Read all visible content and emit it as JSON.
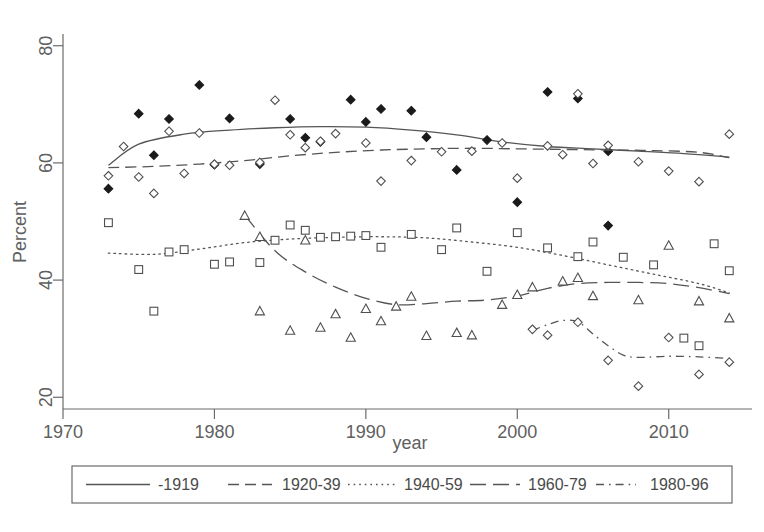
{
  "chart_data": {
    "type": "scatter",
    "title": "",
    "xlabel": "year",
    "ylabel": "Percent",
    "xlim": [
      1970,
      2015.5
    ],
    "ylim": [
      18,
      82
    ],
    "xticks": [
      1970,
      1980,
      1990,
      2000,
      2010
    ],
    "yticks": [
      20,
      40,
      60,
      80
    ],
    "grid": false,
    "legend_position": "below-axes",
    "series": [
      {
        "name": "-1919",
        "marker": "filled-diamond",
        "linestyle": "solid",
        "points": [
          {
            "x": 1973,
            "y": 55.6
          },
          {
            "x": 1975,
            "y": 68.4
          },
          {
            "x": 1976,
            "y": 61.3
          },
          {
            "x": 1977,
            "y": 67.5
          },
          {
            "x": 1979,
            "y": 73.3
          },
          {
            "x": 1980,
            "y": 59.7
          },
          {
            "x": 1981,
            "y": 67.6
          },
          {
            "x": 1983,
            "y": 59.8
          },
          {
            "x": 1985,
            "y": 67.5
          },
          {
            "x": 1986,
            "y": 64.3
          },
          {
            "x": 1987,
            "y": 63.6
          },
          {
            "x": 1989,
            "y": 70.8
          },
          {
            "x": 1990,
            "y": 67.0
          },
          {
            "x": 1991,
            "y": 69.2
          },
          {
            "x": 1993,
            "y": 68.9
          },
          {
            "x": 1994,
            "y": 64.4
          },
          {
            "x": 1996,
            "y": 58.8
          },
          {
            "x": 1998,
            "y": 63.9
          },
          {
            "x": 2000,
            "y": 53.3
          },
          {
            "x": 2002,
            "y": 72.1
          },
          {
            "x": 2004,
            "y": 71.0
          },
          {
            "x": 2006,
            "y": 62.0
          },
          {
            "x": 2006,
            "y": 49.3
          }
        ],
        "fit": [
          {
            "x": 1973,
            "y": 59.6
          },
          {
            "x": 1975,
            "y": 63.2
          },
          {
            "x": 1978,
            "y": 64.9
          },
          {
            "x": 1981,
            "y": 65.6
          },
          {
            "x": 1984,
            "y": 66.0
          },
          {
            "x": 1987,
            "y": 66.2
          },
          {
            "x": 1990,
            "y": 66.1
          },
          {
            "x": 1993,
            "y": 65.6
          },
          {
            "x": 1996,
            "y": 64.8
          },
          {
            "x": 1999,
            "y": 63.6
          },
          {
            "x": 2002,
            "y": 62.8
          },
          {
            "x": 2005,
            "y": 62.4
          },
          {
            "x": 2008,
            "y": 62.0
          },
          {
            "x": 2011,
            "y": 61.6
          },
          {
            "x": 2014,
            "y": 61.0
          }
        ]
      },
      {
        "name": "1920-39",
        "marker": "open-diamond",
        "linestyle": "dashed",
        "points": [
          {
            "x": 1973,
            "y": 57.8
          },
          {
            "x": 1974,
            "y": 62.8
          },
          {
            "x": 1975,
            "y": 57.6
          },
          {
            "x": 1976,
            "y": 54.8
          },
          {
            "x": 1977,
            "y": 65.4
          },
          {
            "x": 1978,
            "y": 58.2
          },
          {
            "x": 1979,
            "y": 65.1
          },
          {
            "x": 1980,
            "y": 59.8
          },
          {
            "x": 1981,
            "y": 59.6
          },
          {
            "x": 1983,
            "y": 60.1
          },
          {
            "x": 1984,
            "y": 70.7
          },
          {
            "x": 1985,
            "y": 64.8
          },
          {
            "x": 1986,
            "y": 62.6
          },
          {
            "x": 1987,
            "y": 63.7
          },
          {
            "x": 1988,
            "y": 65.0
          },
          {
            "x": 1990,
            "y": 63.4
          },
          {
            "x": 1991,
            "y": 56.9
          },
          {
            "x": 1993,
            "y": 60.4
          },
          {
            "x": 1995,
            "y": 61.9
          },
          {
            "x": 1997,
            "y": 62.0
          },
          {
            "x": 1999,
            "y": 63.4
          },
          {
            "x": 2000,
            "y": 57.4
          },
          {
            "x": 2002,
            "y": 62.9
          },
          {
            "x": 2003,
            "y": 61.4
          },
          {
            "x": 2004,
            "y": 71.8
          },
          {
            "x": 2005,
            "y": 59.9
          },
          {
            "x": 2006,
            "y": 63.0
          },
          {
            "x": 2008,
            "y": 60.2
          },
          {
            "x": 2010,
            "y": 58.6
          },
          {
            "x": 2012,
            "y": 56.8
          },
          {
            "x": 2014,
            "y": 64.9
          }
        ],
        "fit": [
          {
            "x": 1973,
            "y": 59.2
          },
          {
            "x": 1976,
            "y": 59.4
          },
          {
            "x": 1979,
            "y": 59.8
          },
          {
            "x": 1982,
            "y": 60.4
          },
          {
            "x": 1985,
            "y": 61.2
          },
          {
            "x": 1988,
            "y": 61.8
          },
          {
            "x": 1991,
            "y": 62.2
          },
          {
            "x": 1994,
            "y": 62.4
          },
          {
            "x": 1997,
            "y": 62.5
          },
          {
            "x": 2000,
            "y": 62.4
          },
          {
            "x": 2003,
            "y": 62.3
          },
          {
            "x": 2006,
            "y": 62.2
          },
          {
            "x": 2009,
            "y": 62.1
          },
          {
            "x": 2012,
            "y": 61.8
          },
          {
            "x": 2014,
            "y": 60.9
          }
        ]
      },
      {
        "name": "1940-59",
        "marker": "open-square",
        "linestyle": "dotted",
        "points": [
          {
            "x": 1973,
            "y": 49.8
          },
          {
            "x": 1975,
            "y": 41.8
          },
          {
            "x": 1976,
            "y": 34.7
          },
          {
            "x": 1977,
            "y": 44.8
          },
          {
            "x": 1978,
            "y": 45.2
          },
          {
            "x": 1980,
            "y": 42.7
          },
          {
            "x": 1981,
            "y": 43.1
          },
          {
            "x": 1983,
            "y": 43.0
          },
          {
            "x": 1984,
            "y": 46.8
          },
          {
            "x": 1985,
            "y": 49.4
          },
          {
            "x": 1986,
            "y": 48.5
          },
          {
            "x": 1987,
            "y": 47.3
          },
          {
            "x": 1988,
            "y": 47.4
          },
          {
            "x": 1989,
            "y": 47.5
          },
          {
            "x": 1990,
            "y": 47.6
          },
          {
            "x": 1991,
            "y": 45.6
          },
          {
            "x": 1993,
            "y": 47.8
          },
          {
            "x": 1995,
            "y": 45.2
          },
          {
            "x": 1996,
            "y": 48.9
          },
          {
            "x": 1998,
            "y": 41.5
          },
          {
            "x": 2000,
            "y": 48.1
          },
          {
            "x": 2002,
            "y": 45.5
          },
          {
            "x": 2004,
            "y": 44.0
          },
          {
            "x": 2005,
            "y": 46.5
          },
          {
            "x": 2007,
            "y": 43.9
          },
          {
            "x": 2009,
            "y": 42.6
          },
          {
            "x": 2011,
            "y": 30.1
          },
          {
            "x": 2012,
            "y": 28.8
          },
          {
            "x": 2013,
            "y": 46.2
          },
          {
            "x": 2014,
            "y": 41.6
          }
        ],
        "fit": [
          {
            "x": 1973,
            "y": 44.6
          },
          {
            "x": 1976,
            "y": 44.4
          },
          {
            "x": 1979,
            "y": 45.3
          },
          {
            "x": 1982,
            "y": 46.4
          },
          {
            "x": 1985,
            "y": 47.0
          },
          {
            "x": 1988,
            "y": 47.3
          },
          {
            "x": 1991,
            "y": 47.4
          },
          {
            "x": 1994,
            "y": 47.2
          },
          {
            "x": 1997,
            "y": 46.5
          },
          {
            "x": 2000,
            "y": 45.6
          },
          {
            "x": 2003,
            "y": 44.2
          },
          {
            "x": 2006,
            "y": 42.6
          },
          {
            "x": 2009,
            "y": 41.0
          },
          {
            "x": 2012,
            "y": 39.4
          },
          {
            "x": 2014,
            "y": 37.8
          }
        ]
      },
      {
        "name": "1960-79",
        "marker": "open-triangle",
        "linestyle": "longdash",
        "points": [
          {
            "x": 1982,
            "y": 51.0
          },
          {
            "x": 1983,
            "y": 47.4
          },
          {
            "x": 1983,
            "y": 34.7
          },
          {
            "x": 1985,
            "y": 31.4
          },
          {
            "x": 1986,
            "y": 46.8
          },
          {
            "x": 1987,
            "y": 31.9
          },
          {
            "x": 1988,
            "y": 34.2
          },
          {
            "x": 1989,
            "y": 30.2
          },
          {
            "x": 1990,
            "y": 35.1
          },
          {
            "x": 1991,
            "y": 33.0
          },
          {
            "x": 1992,
            "y": 35.5
          },
          {
            "x": 1993,
            "y": 37.2
          },
          {
            "x": 1994,
            "y": 30.5
          },
          {
            "x": 1996,
            "y": 31.0
          },
          {
            "x": 1997,
            "y": 30.6
          },
          {
            "x": 1999,
            "y": 35.8
          },
          {
            "x": 2000,
            "y": 37.5
          },
          {
            "x": 2001,
            "y": 38.8
          },
          {
            "x": 2003,
            "y": 39.8
          },
          {
            "x": 2004,
            "y": 40.4
          },
          {
            "x": 2005,
            "y": 37.3
          },
          {
            "x": 2008,
            "y": 36.6
          },
          {
            "x": 2010,
            "y": 45.9
          },
          {
            "x": 2012,
            "y": 36.4
          },
          {
            "x": 2014,
            "y": 33.5
          }
        ],
        "fit": [
          {
            "x": 1982,
            "y": 51.1
          },
          {
            "x": 1984,
            "y": 45.0
          },
          {
            "x": 1986,
            "y": 41.4
          },
          {
            "x": 1988,
            "y": 38.8
          },
          {
            "x": 1990,
            "y": 36.9
          },
          {
            "x": 1992,
            "y": 35.8
          },
          {
            "x": 1994,
            "y": 36.0
          },
          {
            "x": 1996,
            "y": 36.4
          },
          {
            "x": 1998,
            "y": 36.6
          },
          {
            "x": 2000,
            "y": 37.3
          },
          {
            "x": 2002,
            "y": 38.6
          },
          {
            "x": 2004,
            "y": 39.4
          },
          {
            "x": 2006,
            "y": 39.6
          },
          {
            "x": 2008,
            "y": 39.6
          },
          {
            "x": 2010,
            "y": 39.4
          },
          {
            "x": 2012,
            "y": 38.7
          },
          {
            "x": 2014,
            "y": 37.7
          }
        ]
      },
      {
        "name": "1980-96",
        "marker": "open-diamond",
        "linestyle": "dashdot",
        "points": [
          {
            "x": 2001,
            "y": 31.6
          },
          {
            "x": 2002,
            "y": 30.6
          },
          {
            "x": 2004,
            "y": 32.8
          },
          {
            "x": 2006,
            "y": 26.3
          },
          {
            "x": 2008,
            "y": 21.9
          },
          {
            "x": 2010,
            "y": 30.2
          },
          {
            "x": 2012,
            "y": 23.9
          },
          {
            "x": 2014,
            "y": 26.0
          }
        ],
        "fit": [
          {
            "x": 2001,
            "y": 31.4
          },
          {
            "x": 2002,
            "y": 32.4
          },
          {
            "x": 2003,
            "y": 33.1
          },
          {
            "x": 2004,
            "y": 32.9
          },
          {
            "x": 2005,
            "y": 30.8
          },
          {
            "x": 2006,
            "y": 28.8
          },
          {
            "x": 2007,
            "y": 27.2
          },
          {
            "x": 2008,
            "y": 26.8
          },
          {
            "x": 2010,
            "y": 27.0
          },
          {
            "x": 2012,
            "y": 26.9
          },
          {
            "x": 2014,
            "y": 26.6
          }
        ]
      }
    ]
  },
  "axes": {
    "ylabel": "Percent",
    "xlabel": "year",
    "ytick_labels": [
      "20",
      "40",
      "60",
      "80"
    ],
    "xtick_labels": [
      "1970",
      "1980",
      "1990",
      "2000",
      "2010"
    ]
  },
  "legend": {
    "entries": [
      {
        "label": "-1919",
        "style": "solid"
      },
      {
        "label": "1920-39",
        "style": "dashed"
      },
      {
        "label": "1940-59",
        "style": "dotted"
      },
      {
        "label": "1960-79",
        "style": "longdash"
      },
      {
        "label": "1980-96",
        "style": "dashdot"
      }
    ]
  },
  "colors": {
    "axis": "#6b6b6b",
    "text": "#606060",
    "line": "#555555",
    "marker_open": "#ffffff",
    "marker_stroke": "#4f4f4f",
    "marker_filled": "#1a1a1a",
    "background": "#ffffff"
  }
}
